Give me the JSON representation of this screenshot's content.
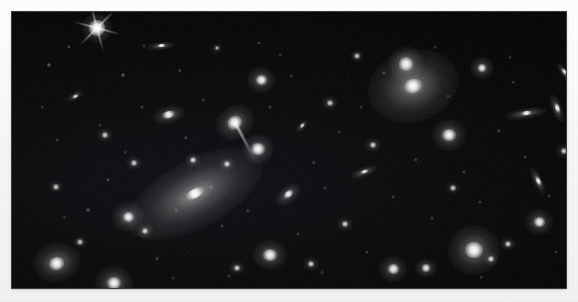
{
  "image": {
    "title": "Galaxy cluster field",
    "kind": "astronomical-photograph",
    "medium": "monochrome photographic plate",
    "caption": "",
    "frame": {
      "x": 12,
      "y": 12,
      "width": 554,
      "height": 276
    },
    "background_color": "#f6f6f6",
    "sky_color": "#000000",
    "object_color": "#ffffff"
  },
  "field": {
    "width": 554,
    "height": 276,
    "description": "Dense cluster of elliptical and lenticular galaxies on a black sky, with one dominant cD galaxy left of center and a second large elliptical with a double nucleus at upper right."
  },
  "objects": [
    {
      "name": "foreground-star-diffraction",
      "type": "star",
      "x": 85,
      "y": 16,
      "r": 7,
      "halo": 15,
      "brightness": 1.0,
      "angle": 0,
      "axis": 1.0,
      "spikes": true
    },
    {
      "name": "dominant-cd-galaxy",
      "type": "elliptical",
      "x": 183,
      "y": 182,
      "r": 9,
      "halo": 74,
      "brightness": 1.0,
      "angle": -28,
      "axis": 0.46,
      "spikes": false
    },
    {
      "name": "second-brightest-elliptical",
      "type": "elliptical",
      "x": 401,
      "y": 74,
      "r": 8,
      "halo": 46,
      "brightness": 0.98,
      "angle": -18,
      "axis": 0.78,
      "spikes": false
    },
    {
      "name": "double-nucleus-companion",
      "type": "elliptical",
      "x": 394,
      "y": 52,
      "r": 6,
      "halo": 18,
      "brightness": 0.93,
      "angle": 0,
      "axis": 1.0,
      "spikes": false
    },
    {
      "name": "tidal-tail-galaxy",
      "type": "elliptical",
      "x": 223,
      "y": 110,
      "r": 7,
      "halo": 20,
      "brightness": 0.96,
      "angle": -35,
      "axis": 0.82,
      "spikes": false
    },
    {
      "name": "edge-on-lenticular-right",
      "type": "lenticular",
      "x": 514,
      "y": 101,
      "r": 5,
      "halo": 21,
      "brightness": 0.92,
      "angle": -8,
      "axis": 0.26,
      "spikes": false
    },
    {
      "name": "bright-round-elliptical-lower-right",
      "type": "elliptical",
      "x": 462,
      "y": 238,
      "r": 8,
      "halo": 26,
      "brightness": 0.97,
      "angle": 0,
      "axis": 0.95,
      "spikes": false
    },
    {
      "name": "bright-elliptical-lower-left",
      "type": "elliptical",
      "x": 45,
      "y": 251,
      "r": 7,
      "halo": 24,
      "brightness": 0.95,
      "angle": -12,
      "axis": 0.82,
      "spikes": false
    },
    {
      "name": "bright-elliptical-bottom-left-2",
      "type": "elliptical",
      "x": 102,
      "y": 271,
      "r": 6,
      "halo": 19,
      "brightness": 0.93,
      "angle": 0,
      "axis": 0.9,
      "spikes": false
    },
    {
      "name": "elliptical-upper-left-pair",
      "type": "elliptical",
      "x": 116,
      "y": 205,
      "r": 5,
      "halo": 16,
      "brightness": 0.9,
      "angle": 0,
      "axis": 0.95,
      "spikes": false
    },
    {
      "name": "lenticular-upper-center",
      "type": "lenticular",
      "x": 149,
      "y": 34,
      "r": 4,
      "halo": 14,
      "brightness": 0.9,
      "angle": -6,
      "axis": 0.3,
      "spikes": false
    },
    {
      "name": "elliptical-left-mid",
      "type": "elliptical",
      "x": 157,
      "y": 103,
      "r": 6,
      "halo": 16,
      "brightness": 0.92,
      "angle": -14,
      "axis": 0.55,
      "spikes": false
    },
    {
      "name": "elliptical-center-top",
      "type": "elliptical",
      "x": 249,
      "y": 68,
      "r": 5,
      "halo": 14,
      "brightness": 0.9,
      "angle": 0,
      "axis": 0.95,
      "spikes": false
    },
    {
      "name": "elliptical-center-mid",
      "type": "elliptical",
      "x": 246,
      "y": 137,
      "r": 6,
      "halo": 16,
      "brightness": 0.94,
      "angle": 0,
      "axis": 0.95,
      "spikes": false
    },
    {
      "name": "spiral-center-lower",
      "type": "spiral",
      "x": 276,
      "y": 182,
      "r": 5,
      "halo": 15,
      "brightness": 0.9,
      "angle": -40,
      "axis": 0.55,
      "spikes": false
    },
    {
      "name": "elliptical-lower-center",
      "type": "elliptical",
      "x": 258,
      "y": 243,
      "r": 6,
      "halo": 17,
      "brightness": 0.92,
      "angle": 0,
      "axis": 0.9,
      "spikes": false
    },
    {
      "name": "lenticular-mid-right",
      "type": "lenticular",
      "x": 352,
      "y": 160,
      "r": 4,
      "halo": 14,
      "brightness": 0.86,
      "angle": -20,
      "axis": 0.35,
      "spikes": false
    },
    {
      "name": "elliptical-right-mid",
      "type": "elliptical",
      "x": 437,
      "y": 123,
      "r": 6,
      "halo": 17,
      "brightness": 0.92,
      "angle": 0,
      "axis": 0.92,
      "spikes": false
    },
    {
      "name": "elliptical-right-upper",
      "type": "elliptical",
      "x": 470,
      "y": 56,
      "r": 4,
      "halo": 12,
      "brightness": 0.86,
      "angle": 0,
      "axis": 0.95,
      "spikes": false
    },
    {
      "name": "lenticular-far-right",
      "type": "lenticular",
      "x": 545,
      "y": 96,
      "r": 5,
      "halo": 15,
      "brightness": 0.88,
      "angle": 70,
      "axis": 0.35,
      "spikes": false
    },
    {
      "name": "lenticular-top-right",
      "type": "lenticular",
      "x": 552,
      "y": 60,
      "r": 4,
      "halo": 11,
      "brightness": 0.82,
      "angle": 55,
      "axis": 0.35,
      "spikes": false
    },
    {
      "name": "elliptical-bottom-right",
      "type": "elliptical",
      "x": 527,
      "y": 210,
      "r": 5,
      "halo": 14,
      "brightness": 0.88,
      "angle": 0,
      "axis": 0.92,
      "spikes": false
    },
    {
      "name": "lenticular-bottom-right-edge",
      "type": "lenticular",
      "x": 526,
      "y": 169,
      "r": 5,
      "halo": 15,
      "brightness": 0.86,
      "angle": 65,
      "axis": 0.32,
      "spikes": false
    },
    {
      "name": "elliptical-bottom-center",
      "type": "elliptical",
      "x": 381,
      "y": 257,
      "r": 5,
      "halo": 14,
      "brightness": 0.88,
      "angle": 0,
      "axis": 0.9,
      "spikes": false
    },
    {
      "name": "elliptical-bottom-mid",
      "type": "elliptical",
      "x": 414,
      "y": 256,
      "r": 4,
      "halo": 11,
      "brightness": 0.82,
      "angle": 0,
      "axis": 0.9,
      "spikes": false
    },
    {
      "name": "compact-galaxy-1",
      "type": "compact",
      "x": 63,
      "y": 84,
      "r": 3,
      "halo": 9,
      "brightness": 0.78,
      "angle": -30,
      "axis": 0.45,
      "spikes": false
    },
    {
      "name": "compact-galaxy-2",
      "type": "compact",
      "x": 93,
      "y": 123,
      "r": 3,
      "halo": 8,
      "brightness": 0.7,
      "angle": 0,
      "axis": 0.9,
      "spikes": false
    },
    {
      "name": "compact-galaxy-3",
      "type": "compact",
      "x": 122,
      "y": 151,
      "r": 3,
      "halo": 8,
      "brightness": 0.7,
      "angle": 0,
      "axis": 0.9,
      "spikes": false
    },
    {
      "name": "compact-galaxy-4",
      "type": "compact",
      "x": 133,
      "y": 219,
      "r": 3,
      "halo": 9,
      "brightness": 0.74,
      "angle": 0,
      "axis": 0.9,
      "spikes": false
    },
    {
      "name": "compact-galaxy-5",
      "type": "compact",
      "x": 181,
      "y": 148,
      "r": 3,
      "halo": 8,
      "brightness": 0.76,
      "angle": 0,
      "axis": 0.9,
      "spikes": false
    },
    {
      "name": "compact-galaxy-6",
      "type": "compact",
      "x": 215,
      "y": 152,
      "r": 3,
      "halo": 8,
      "brightness": 0.72,
      "angle": 0,
      "axis": 0.9,
      "spikes": false
    },
    {
      "name": "compact-galaxy-7",
      "type": "compact",
      "x": 290,
      "y": 114,
      "r": 3,
      "halo": 8,
      "brightness": 0.72,
      "angle": -50,
      "axis": 0.5,
      "spikes": false
    },
    {
      "name": "compact-galaxy-8",
      "type": "compact",
      "x": 318,
      "y": 91,
      "r": 3,
      "halo": 8,
      "brightness": 0.7,
      "angle": 0,
      "axis": 0.9,
      "spikes": false
    },
    {
      "name": "compact-galaxy-9",
      "type": "compact",
      "x": 333,
      "y": 212,
      "r": 3,
      "halo": 8,
      "brightness": 0.72,
      "angle": 0,
      "axis": 0.9,
      "spikes": false
    },
    {
      "name": "compact-galaxy-10",
      "type": "compact",
      "x": 361,
      "y": 133,
      "r": 3,
      "halo": 8,
      "brightness": 0.7,
      "angle": 0,
      "axis": 0.9,
      "spikes": false
    },
    {
      "name": "compact-galaxy-11",
      "type": "compact",
      "x": 299,
      "y": 252,
      "r": 3,
      "halo": 8,
      "brightness": 0.7,
      "angle": 0,
      "axis": 0.9,
      "spikes": false
    },
    {
      "name": "compact-galaxy-12",
      "type": "compact",
      "x": 479,
      "y": 247,
      "r": 3,
      "halo": 8,
      "brightness": 0.72,
      "angle": 0,
      "axis": 0.9,
      "spikes": false
    },
    {
      "name": "compact-galaxy-13",
      "type": "compact",
      "x": 496,
      "y": 232,
      "r": 3,
      "halo": 8,
      "brightness": 0.7,
      "angle": 0,
      "axis": 0.9,
      "spikes": false
    },
    {
      "name": "compact-galaxy-14",
      "type": "compact",
      "x": 225,
      "y": 256,
      "r": 3,
      "halo": 8,
      "brightness": 0.7,
      "angle": 0,
      "axis": 0.9,
      "spikes": false
    },
    {
      "name": "compact-galaxy-15",
      "type": "compact",
      "x": 44,
      "y": 175,
      "r": 3,
      "halo": 7,
      "brightness": 0.66,
      "angle": 0,
      "axis": 0.9,
      "spikes": false
    },
    {
      "name": "compact-galaxy-16",
      "type": "compact",
      "x": 345,
      "y": 44,
      "r": 3,
      "halo": 7,
      "brightness": 0.64,
      "angle": 0,
      "axis": 0.9,
      "spikes": false
    },
    {
      "name": "compact-galaxy-17",
      "type": "compact",
      "x": 441,
      "y": 176,
      "r": 3,
      "halo": 7,
      "brightness": 0.64,
      "angle": 0,
      "axis": 0.9,
      "spikes": false
    },
    {
      "name": "compact-galaxy-18",
      "type": "compact",
      "x": 205,
      "y": 36,
      "r": 2,
      "halo": 6,
      "brightness": 0.6,
      "angle": 0,
      "axis": 0.9,
      "spikes": false
    },
    {
      "name": "compact-galaxy-19",
      "type": "compact",
      "x": 552,
      "y": 139,
      "r": 3,
      "halo": 8,
      "brightness": 0.7,
      "angle": 0,
      "axis": 0.9,
      "spikes": false
    },
    {
      "name": "compact-galaxy-20",
      "type": "compact",
      "x": 68,
      "y": 230,
      "r": 3,
      "halo": 7,
      "brightness": 0.64,
      "angle": 0,
      "axis": 0.9,
      "spikes": false
    }
  ],
  "faint_points": [
    [
      37,
      53,
      1.3,
      0.45
    ],
    [
      57,
      35,
      1.1,
      0.38
    ],
    [
      111,
      63,
      1.2,
      0.4
    ],
    [
      130,
      95,
      1.0,
      0.34
    ],
    [
      96,
      168,
      1.1,
      0.36
    ],
    [
      76,
      198,
      1.2,
      0.4
    ],
    [
      45,
      128,
      1.0,
      0.3
    ],
    [
      30,
      95,
      0.9,
      0.28
    ],
    [
      168,
      59,
      1.1,
      0.36
    ],
    [
      191,
      88,
      1.0,
      0.32
    ],
    [
      174,
      126,
      1.1,
      0.36
    ],
    [
      199,
      175,
      1.0,
      0.32
    ],
    [
      145,
      247,
      1.1,
      0.34
    ],
    [
      164,
      198,
      0.9,
      0.28
    ],
    [
      210,
      214,
      1.0,
      0.32
    ],
    [
      236,
      199,
      1.1,
      0.34
    ],
    [
      258,
      95,
      1.0,
      0.32
    ],
    [
      279,
      64,
      0.9,
      0.28
    ],
    [
      302,
      151,
      1.1,
      0.34
    ],
    [
      313,
      176,
      1.0,
      0.3
    ],
    [
      286,
      222,
      1.0,
      0.32
    ],
    [
      327,
      120,
      0.9,
      0.28
    ],
    [
      349,
      95,
      1.0,
      0.3
    ],
    [
      372,
      61,
      1.1,
      0.34
    ],
    [
      381,
      185,
      1.0,
      0.32
    ],
    [
      404,
      148,
      1.1,
      0.34
    ],
    [
      420,
      206,
      1.0,
      0.3
    ],
    [
      436,
      84,
      0.9,
      0.28
    ],
    [
      452,
      160,
      1.0,
      0.32
    ],
    [
      468,
      190,
      1.0,
      0.3
    ],
    [
      487,
      119,
      1.1,
      0.34
    ],
    [
      501,
      70,
      0.9,
      0.28
    ],
    [
      513,
      145,
      1.0,
      0.3
    ],
    [
      537,
      184,
      1.0,
      0.32
    ],
    [
      544,
      240,
      1.0,
      0.3
    ],
    [
      498,
      45,
      0.9,
      0.26
    ],
    [
      247,
      31,
      1.0,
      0.3
    ],
    [
      268,
      43,
      0.9,
      0.26
    ],
    [
      132,
      34,
      1.0,
      0.3
    ],
    [
      88,
      113,
      0.9,
      0.26
    ],
    [
      217,
      264,
      1.0,
      0.3
    ],
    [
      355,
      240,
      0.9,
      0.28
    ],
    [
      161,
      266,
      0.9,
      0.26
    ],
    [
      423,
      35,
      0.9,
      0.26
    ],
    [
      52,
      205,
      0.9,
      0.26
    ],
    [
      113,
      140,
      0.9,
      0.26
    ],
    [
      310,
      260,
      0.9,
      0.26
    ],
    [
      469,
      265,
      0.9,
      0.26
    ]
  ]
}
